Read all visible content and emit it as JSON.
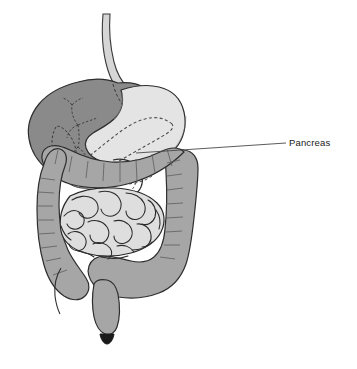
{
  "figure": {
    "background_color": "#ffffff",
    "width": 357,
    "height": 369
  },
  "labels": [
    {
      "id": "pancreas",
      "text": "Pancreas",
      "icon": "leader-line",
      "x": 289,
      "y": 138,
      "leader_from": [
        136,
        153
      ],
      "leader_to": [
        286,
        143
      ],
      "color": "#1a1a1a"
    }
  ],
  "organs": [
    {
      "id": "esophagus",
      "name": "Esophagus",
      "fill": "#d6d6d6",
      "stroke": "#3a3a3a"
    },
    {
      "id": "liver",
      "name": "Liver",
      "fill": "#8a8a8a",
      "stroke": "#2e2e2e"
    },
    {
      "id": "gallbladder",
      "name": "Gallbladder",
      "fill": "#8a8a8a",
      "stroke": "#2e2e2e"
    },
    {
      "id": "stomach",
      "name": "Stomach",
      "fill": "#e4e4e4",
      "stroke": "#2e2e2e"
    },
    {
      "id": "pancreas",
      "name": "Pancreas",
      "fill": "none",
      "stroke": "#4a4a4a",
      "stroke_style": "dashed"
    },
    {
      "id": "duodenum",
      "name": "Duodenum",
      "fill": "#dcdcdc",
      "stroke": "#2e2e2e"
    },
    {
      "id": "colon",
      "name": "Large intestine (colon)",
      "fill": "#a6a6a6",
      "stroke": "#2e2e2e"
    },
    {
      "id": "small-intestine",
      "name": "Small intestine",
      "fill": "#dedede",
      "stroke": "#2a2a2a"
    },
    {
      "id": "rectum",
      "name": "Rectum",
      "fill": "#a6a6a6",
      "stroke": "#2e2e2e"
    },
    {
      "id": "anus",
      "name": "Anus",
      "fill": "#1a1a1a",
      "stroke": "#1a1a1a"
    },
    {
      "id": "appendix",
      "name": "Appendix",
      "fill": "none",
      "stroke": "#2e2e2e"
    }
  ],
  "markers": [
    {
      "id": "bracket-right",
      "name": "measurement-bracket",
      "color": "#9a9a9a"
    }
  ],
  "colors": {
    "liver": "#8a8a8a",
    "stomach": "#e4e4e4",
    "colon": "#a6a6a6",
    "small_intestine": "#dedede",
    "esophagus": "#d6d6d6",
    "outline": "#2e2e2e",
    "dashed": "#4a4a4a",
    "bracket": "#9a9a9a",
    "label": "#1a1a1a"
  }
}
